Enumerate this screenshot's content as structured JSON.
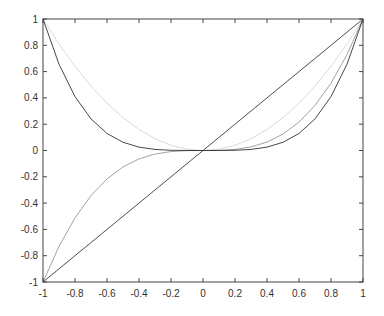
{
  "chart_data": {
    "type": "line",
    "title": "",
    "xlabel": "",
    "ylabel": "",
    "xlim": [
      -1,
      1
    ],
    "ylim": [
      -1,
      1
    ],
    "grid": false,
    "legend": null,
    "xticks": [
      "-1",
      "-0.8",
      "-0.6",
      "-0.4",
      "-0.2",
      "0",
      "0.2",
      "0.4",
      "0.6",
      "0.8",
      "1"
    ],
    "yticks": [
      "-1",
      "-0.8",
      "-0.6",
      "-0.4",
      "-0.2",
      "0",
      "0.2",
      "0.4",
      "0.6",
      "0.8",
      "1"
    ],
    "x": [
      -1,
      -0.9,
      -0.8,
      -0.7,
      -0.6,
      -0.5,
      -0.4,
      -0.3,
      -0.2,
      -0.1,
      0,
      0.1,
      0.2,
      0.3,
      0.4,
      0.5,
      0.6,
      0.7,
      0.8,
      0.9,
      1
    ],
    "series": [
      {
        "name": "y = x",
        "color": "#222222",
        "width": 0.8,
        "values": [
          -1,
          -0.9,
          -0.8,
          -0.7,
          -0.6,
          -0.5,
          -0.4,
          -0.3,
          -0.2,
          -0.1,
          0,
          0.1,
          0.2,
          0.3,
          0.4,
          0.5,
          0.6,
          0.7,
          0.8,
          0.9,
          1
        ]
      },
      {
        "name": "y = x^2",
        "color": "#d0d0d0",
        "width": 0.8,
        "values": [
          1,
          0.81,
          0.64,
          0.49,
          0.36,
          0.25,
          0.16,
          0.09,
          0.04,
          0.01,
          0,
          0.01,
          0.04,
          0.09,
          0.16,
          0.25,
          0.36,
          0.49,
          0.64,
          0.81,
          1
        ]
      },
      {
        "name": "y = x^3",
        "color": "#8a8a8a",
        "width": 0.8,
        "values": [
          -1,
          -0.729,
          -0.512,
          -0.343,
          -0.216,
          -0.125,
          -0.064,
          -0.027,
          -0.008,
          -0.001,
          0,
          0.001,
          0.008,
          0.027,
          0.064,
          0.125,
          0.216,
          0.343,
          0.512,
          0.729,
          1
        ]
      },
      {
        "name": "y = x^4",
        "color": "#333333",
        "width": 0.9,
        "values": [
          1,
          0.6561,
          0.4096,
          0.2401,
          0.1296,
          0.0625,
          0.0256,
          0.0081,
          0.0016,
          0.0001,
          0,
          0.0001,
          0.0016,
          0.0081,
          0.0256,
          0.0625,
          0.1296,
          0.2401,
          0.4096,
          0.6561,
          1
        ]
      }
    ]
  }
}
